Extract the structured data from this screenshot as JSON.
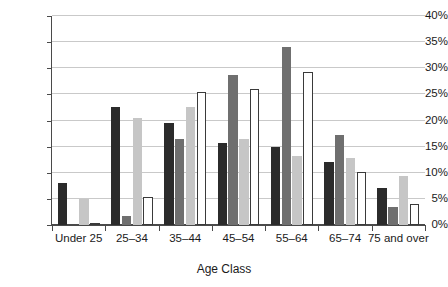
{
  "chart_data": {
    "type": "bar",
    "title": "",
    "xlabel": "Age Class",
    "ylabel": "",
    "ylim": [
      0,
      40
    ],
    "ytick_step": 5,
    "ytick_labels": [
      "0%",
      "5%",
      "10%",
      "15%",
      "20%",
      "25%",
      "30%",
      "35%",
      "40%"
    ],
    "ytick_values": [
      0,
      5,
      10,
      15,
      20,
      25,
      30,
      35,
      40
    ],
    "grid": true,
    "legend": "none",
    "categories": [
      "Under 25",
      "25–34",
      "35–44",
      "45–54",
      "55–64",
      "65–74",
      "75 and over"
    ],
    "series": [
      {
        "name": "series-1",
        "color": "#2b2b2b",
        "values": [
          8.0,
          22.6,
          19.6,
          15.7,
          15.0,
          12.1,
          7.0
        ]
      },
      {
        "name": "series-2",
        "color": "#6f6f6f",
        "values": [
          0.0,
          1.7,
          16.5,
          28.7,
          34.0,
          17.2,
          3.4
        ]
      },
      {
        "name": "series-3",
        "color": "#c6c6c6",
        "values": [
          5.0,
          20.4,
          22.5,
          16.4,
          13.3,
          12.8,
          9.3
        ]
      },
      {
        "name": "series-4",
        "color": "#ffffff",
        "values": [
          0.4,
          5.3,
          25.5,
          26.0,
          29.3,
          10.2,
          4.0
        ]
      }
    ]
  },
  "axis": {
    "x_title": "Age Class"
  },
  "colors": {
    "axis": "#4a4a4a",
    "grid": "#c9c9c9",
    "text": "#1a1a1a",
    "bar_outline": "#3a3a3a",
    "background": "#ffffff"
  }
}
